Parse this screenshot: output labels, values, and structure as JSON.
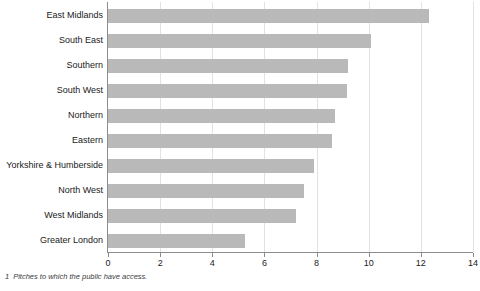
{
  "chart_data": {
    "type": "bar",
    "orientation": "horizontal",
    "title": "",
    "xlabel": "",
    "ylabel": "",
    "xlim": [
      0,
      14
    ],
    "xticks": [
      0,
      2,
      4,
      6,
      8,
      10,
      12,
      14
    ],
    "xtick_labels": [
      "0",
      "2",
      "4",
      "6",
      "8",
      "10",
      "12",
      "14"
    ],
    "grid": true,
    "grid_axis": "x",
    "legend": false,
    "categories": [
      "East Midlands",
      "South East",
      "Southern",
      "South West",
      "Northern",
      "Eastern",
      "Yorkshire & Humberside",
      "North West",
      "West Midlands",
      "Greater London"
    ],
    "values": [
      12.3,
      10.1,
      9.2,
      9.15,
      8.7,
      8.6,
      7.9,
      7.5,
      7.2,
      5.25
    ],
    "bar_color": "#b9b9b9",
    "axis_color": "#8c8c8c",
    "grid_color": "#e2e2e2"
  },
  "footnote": {
    "marker": "1",
    "text": "Pitches to which the public have access."
  }
}
